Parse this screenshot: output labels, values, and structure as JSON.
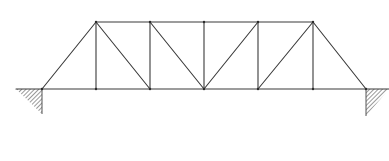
{
  "diagram": {
    "type": "truss-bridge",
    "colors": {
      "member": "#3a3a3a",
      "hatch": "#555555",
      "background": "#ffffff"
    },
    "nodes": {
      "bottom": [
        [
          42,
          89
        ],
        [
          96,
          89
        ],
        [
          150,
          89
        ],
        [
          204,
          89
        ],
        [
          258,
          89
        ],
        [
          313,
          89
        ],
        [
          366,
          89
        ]
      ],
      "top": [
        [
          96,
          22
        ],
        [
          150,
          22
        ],
        [
          204,
          22
        ],
        [
          258,
          22
        ],
        [
          313,
          22
        ]
      ]
    },
    "members": [
      {
        "name": "bottom-chord",
        "x1": 16,
        "y1": 89,
        "x2": 389,
        "y2": 89
      },
      {
        "name": "top-chord",
        "x1": 96,
        "y1": 22,
        "x2": 313,
        "y2": 22
      },
      {
        "name": "end-post-left",
        "x1": 42,
        "y1": 89,
        "x2": 96,
        "y2": 22
      },
      {
        "name": "end-post-right",
        "x1": 313,
        "y1": 22,
        "x2": 366,
        "y2": 89
      },
      {
        "name": "vertical-1",
        "x1": 96,
        "y1": 22,
        "x2": 96,
        "y2": 89
      },
      {
        "name": "vertical-2",
        "x1": 150,
        "y1": 22,
        "x2": 150,
        "y2": 89
      },
      {
        "name": "vertical-3",
        "x1": 204,
        "y1": 22,
        "x2": 204,
        "y2": 89
      },
      {
        "name": "vertical-4",
        "x1": 258,
        "y1": 22,
        "x2": 258,
        "y2": 89
      },
      {
        "name": "vertical-5",
        "x1": 313,
        "y1": 22,
        "x2": 313,
        "y2": 89
      },
      {
        "name": "diagonal-1",
        "x1": 96,
        "y1": 22,
        "x2": 150,
        "y2": 89
      },
      {
        "name": "diagonal-2",
        "x1": 150,
        "y1": 22,
        "x2": 204,
        "y2": 89
      },
      {
        "name": "diagonal-3",
        "x1": 258,
        "y1": 22,
        "x2": 204,
        "y2": 89
      },
      {
        "name": "diagonal-4",
        "x1": 313,
        "y1": 22,
        "x2": 258,
        "y2": 89
      }
    ],
    "supports": [
      {
        "name": "left-support",
        "points": "16,89 42,89 42,114"
      },
      {
        "name": "right-support",
        "points": "366,89 389,89 366,116"
      }
    ]
  }
}
